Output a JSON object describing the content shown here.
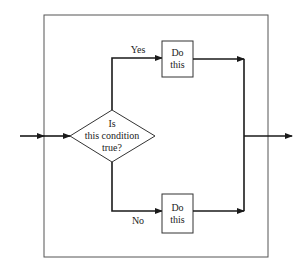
{
  "diagram": {
    "type": "flowchart",
    "decision": {
      "lines": [
        "Is",
        "this condition",
        "true?"
      ]
    },
    "branches": {
      "yes": {
        "label": "Yes",
        "action_lines": [
          "Do",
          "this"
        ]
      },
      "no": {
        "label": "No",
        "action_lines": [
          "Do",
          "this"
        ]
      }
    },
    "colors": {
      "line": "#1a1a1a",
      "frame": "#555555",
      "background": "#ffffff"
    }
  }
}
